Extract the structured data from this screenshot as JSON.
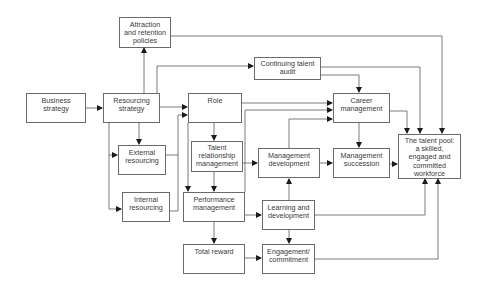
{
  "diagram": {
    "nodes": [
      {
        "id": "attraction",
        "label": "Attraction\nand retention\npolicies"
      },
      {
        "id": "business",
        "label": "Business\nstrategy"
      },
      {
        "id": "resourcing",
        "label": "Resourcing\nstrategy"
      },
      {
        "id": "role",
        "label": "Role"
      },
      {
        "id": "audit",
        "label": "Continuing talent\naudit"
      },
      {
        "id": "career",
        "label": "Career\nmanagement"
      },
      {
        "id": "external",
        "label": "External\nresourcing"
      },
      {
        "id": "trm",
        "label": "Talent\nrelationship\nmanagement"
      },
      {
        "id": "mgmtdev",
        "label": "Management\ndevelopment"
      },
      {
        "id": "succession",
        "label": "Management\nsuccession"
      },
      {
        "id": "pool",
        "label": "The talent pool:\na skilled,\nengaged and\ncommitted\nworkforce"
      },
      {
        "id": "internal",
        "label": "Internal\nresourcing"
      },
      {
        "id": "performance",
        "label": "Performance\nmanagement"
      },
      {
        "id": "learning",
        "label": "Learning and\ndevelopment"
      },
      {
        "id": "reward",
        "label": "Total reward"
      },
      {
        "id": "engagement",
        "label": "Engagement/\ncommitment"
      }
    ],
    "edges": [
      [
        "business",
        "resourcing"
      ],
      [
        "resourcing",
        "attraction"
      ],
      [
        "resourcing",
        "audit"
      ],
      [
        "resourcing",
        "role"
      ],
      [
        "resourcing",
        "external"
      ],
      [
        "resourcing",
        "internal"
      ],
      [
        "external",
        "role"
      ],
      [
        "internal",
        "role"
      ],
      [
        "attraction",
        "pool"
      ],
      [
        "audit",
        "career"
      ],
      [
        "audit",
        "pool"
      ],
      [
        "role",
        "career"
      ],
      [
        "role",
        "trm"
      ],
      [
        "role",
        "performance"
      ],
      [
        "trm",
        "performance"
      ],
      [
        "trm",
        "career"
      ],
      [
        "trm",
        "mgmtdev"
      ],
      [
        "mgmtdev",
        "career"
      ],
      [
        "mgmtdev",
        "succession"
      ],
      [
        "career",
        "succession"
      ],
      [
        "career",
        "pool"
      ],
      [
        "succession",
        "pool"
      ],
      [
        "performance",
        "learning"
      ],
      [
        "performance",
        "reward"
      ],
      [
        "learning",
        "mgmtdev"
      ],
      [
        "learning",
        "engagement"
      ],
      [
        "learning",
        "pool"
      ],
      [
        "reward",
        "engagement"
      ],
      [
        "engagement",
        "pool"
      ]
    ]
  }
}
